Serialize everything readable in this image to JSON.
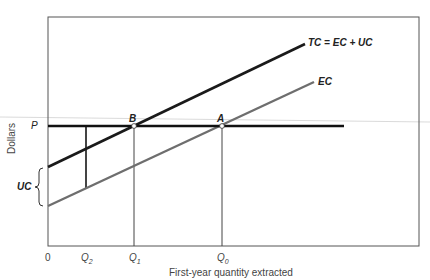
{
  "diagram": {
    "type": "economics-cost-diagram",
    "y_axis_label": "Dollars",
    "x_axis_label": "First-year quantity extracted",
    "origin_label": "0",
    "price_label": "P",
    "uc_brace_label": "UC",
    "curves": [
      {
        "name": "TC",
        "label": "TC = EC + UC",
        "color": "#1a1a1a"
      },
      {
        "name": "EC",
        "label": "EC",
        "color": "#6e6e6e"
      }
    ],
    "points": [
      {
        "label": "B",
        "description": "TC intersects P at Q1"
      },
      {
        "label": "A",
        "description": "EC intersects P at Q0"
      }
    ],
    "x_ticks": [
      {
        "label": "Q",
        "sub": "2"
      },
      {
        "label": "Q",
        "sub": "1"
      },
      {
        "label": "Q",
        "sub": "0"
      }
    ],
    "colors": {
      "frame": "#555555",
      "price_line": "#111111",
      "guide_line": "#444444",
      "stray_line": "#cfcfcf"
    }
  }
}
